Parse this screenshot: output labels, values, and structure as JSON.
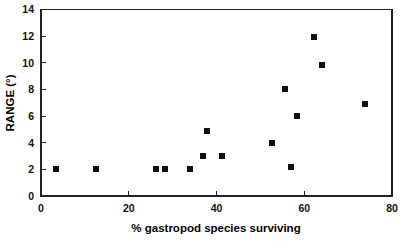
{
  "chart_data": {
    "type": "scatter",
    "title": "",
    "xlabel": "% gastropod species surviving",
    "ylabel": "RANGE (°)",
    "xlim": [
      0,
      80
    ],
    "ylim": [
      0,
      14
    ],
    "xticks": [
      0,
      20,
      40,
      60,
      80
    ],
    "yticks": [
      0,
      2,
      4,
      6,
      8,
      10,
      12,
      14
    ],
    "xtick_labels": [
      "0",
      "20",
      "40",
      "60",
      "80"
    ],
    "ytick_labels": [
      "0",
      "2",
      "4",
      "6",
      "8",
      "10",
      "12",
      "14"
    ],
    "grid": false,
    "legend": null,
    "marker": "square",
    "marker_color": "#101010",
    "marker_size": 6,
    "series": [
      {
        "name": "gastropod range",
        "points": [
          {
            "x": 3.4,
            "y": 2.0
          },
          {
            "x": 12.5,
            "y": 2.0
          },
          {
            "x": 26.2,
            "y": 2.0
          },
          {
            "x": 28.2,
            "y": 2.0
          },
          {
            "x": 34.0,
            "y": 2.0
          },
          {
            "x": 36.9,
            "y": 3.0
          },
          {
            "x": 41.2,
            "y": 3.0
          },
          {
            "x": 37.8,
            "y": 4.9
          },
          {
            "x": 52.6,
            "y": 4.0
          },
          {
            "x": 57.0,
            "y": 2.2
          },
          {
            "x": 55.6,
            "y": 8.0
          },
          {
            "x": 58.3,
            "y": 6.0
          },
          {
            "x": 62.2,
            "y": 11.9
          },
          {
            "x": 64.0,
            "y": 9.8
          },
          {
            "x": 73.8,
            "y": 6.9
          }
        ]
      }
    ]
  },
  "axes": {
    "frame_color": "#222222"
  }
}
